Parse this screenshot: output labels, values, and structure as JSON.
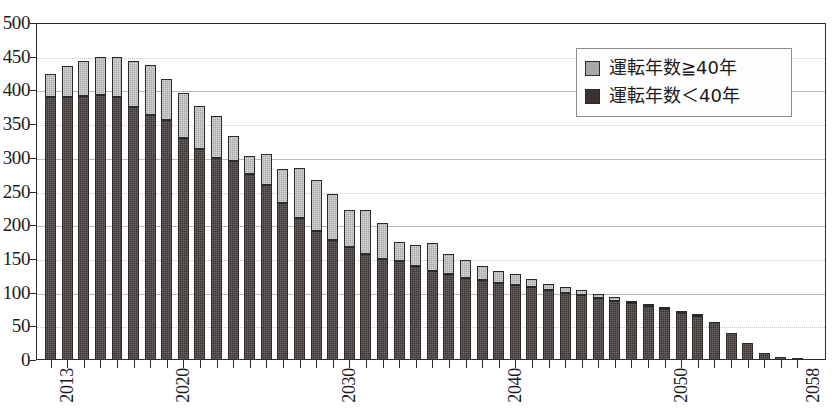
{
  "chart_data": {
    "type": "bar",
    "stacked": true,
    "title": "",
    "xlabel": "",
    "ylabel": "",
    "ylim": [
      0,
      500
    ],
    "ytick_step": 50,
    "ytick_labels": [
      "0",
      "50",
      "100",
      "150",
      "200",
      "250",
      "300",
      "350",
      "400",
      "450",
      "500"
    ],
    "grid": true,
    "legend_position": "top-right",
    "categories": [
      "2013",
      "2014",
      "2015",
      "2016",
      "2017",
      "2018",
      "2019",
      "2020",
      "2021",
      "2022",
      "2023",
      "2024",
      "2025",
      "2026",
      "2027",
      "2028",
      "2029",
      "2030",
      "2031",
      "2032",
      "2033",
      "2034",
      "2035",
      "2036",
      "2037",
      "2038",
      "2039",
      "2040",
      "2041",
      "2042",
      "2043",
      "2044",
      "2045",
      "2046",
      "2047",
      "2048",
      "2049",
      "2050",
      "2051",
      "2052",
      "2053",
      "2054",
      "2055",
      "2056",
      "2057",
      "2058"
    ],
    "xtick_labels_shown": [
      "2013",
      "2020",
      "2030",
      "2040",
      "2050",
      "2058"
    ],
    "series": [
      {
        "name": "運転年数＜40年",
        "color": "#3a3330",
        "values": [
          390,
          390,
          392,
          393,
          390,
          376,
          364,
          356,
          329,
          313,
          299,
          296,
          276,
          260,
          233,
          210,
          191,
          178,
          168,
          157,
          150,
          147,
          140,
          132,
          128,
          121,
          118,
          115,
          111,
          108,
          104,
          99,
          96,
          92,
          88,
          84,
          80,
          76,
          70,
          65,
          57,
          40,
          25,
          10,
          4,
          1
        ]
      },
      {
        "name": "運転年数≧40年",
        "color": "#a8a8a8",
        "values": [
          34,
          46,
          52,
          57,
          60,
          67,
          73,
          61,
          67,
          64,
          63,
          36,
          27,
          45,
          51,
          75,
          76,
          69,
          55,
          65,
          53,
          28,
          31,
          42,
          29,
          28,
          22,
          17,
          16,
          12,
          9,
          10,
          8,
          6,
          5,
          4,
          3,
          2,
          1,
          1,
          0,
          0,
          0,
          0,
          0,
          0
        ]
      }
    ],
    "totals": [
      424,
      436,
      444,
      450,
      450,
      443,
      437,
      417,
      396,
      377,
      362,
      332,
      303,
      305,
      284,
      285,
      267,
      247,
      223,
      222,
      203,
      175,
      171,
      174,
      157,
      149,
      140,
      132,
      127,
      120,
      113,
      109,
      104,
      98,
      93,
      88,
      83,
      78,
      71,
      66,
      57,
      40,
      25,
      10,
      4,
      1
    ]
  },
  "legend": {
    "items": [
      {
        "label": "運転年数≧40年",
        "swatch": "#a8a8a8"
      },
      {
        "label": "運転年数＜40年",
        "swatch": "#3a3330"
      }
    ]
  },
  "caption": {
    "text": ""
  }
}
